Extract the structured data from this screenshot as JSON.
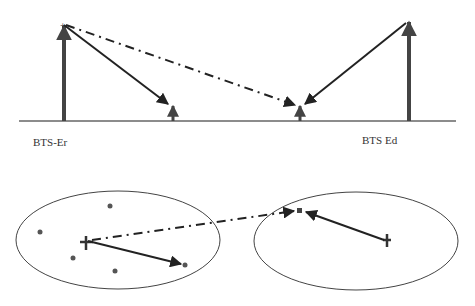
{
  "top_diagram": {
    "labels": {
      "left": "BTS-Er",
      "right": "BTS Ed"
    },
    "elements": {
      "baseline": "horizontal ground line",
      "left_antenna": "tall arrow (BTS-Er)",
      "right_antenna": "tall arrow (BTS Ed)",
      "small_receiver_left": "short arrow",
      "small_receiver_right": "short arrow",
      "dash_dot_link": "BTS-Er to right receiver (dash-dot)"
    }
  },
  "bottom_diagram": {
    "left_ellipse": {
      "points": 5,
      "center_marker": "cross"
    },
    "right_ellipse": {
      "points": 0,
      "center_marker": "cross",
      "target_marker": "square"
    }
  },
  "colors": {
    "line": "#222222",
    "antenna": "#444444",
    "ellipse": "#444444",
    "dot": "#555555"
  }
}
